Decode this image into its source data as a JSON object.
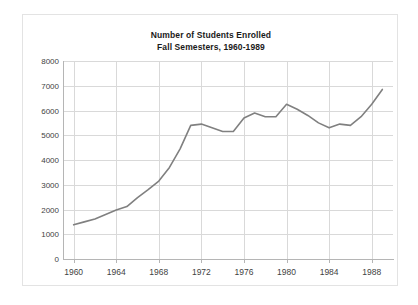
{
  "chart_data": {
    "type": "line",
    "title": "Number of Students Enrolled",
    "subtitle": "Fall Semesters, 1960-1989",
    "title_lines": [
      "Number of Students Enrolled",
      "Fall Semesters, 1960-1989"
    ],
    "xlabel": "",
    "ylabel": "",
    "xlim": [
      1959,
      1990
    ],
    "ylim": [
      0,
      8000
    ],
    "grid": true,
    "legend": "none",
    "line_color": "#808080",
    "grid_color": "#d9d9d9",
    "axis_color": "#b5b5b5",
    "ytick_labels": [
      "8000",
      "7000",
      "6000",
      "5000",
      "4000",
      "3000",
      "2000",
      "1000",
      "0"
    ],
    "ytick_values": [
      8000,
      7000,
      6000,
      5000,
      4000,
      3000,
      2000,
      1000,
      0
    ],
    "xtick_labels": [
      "1960",
      "1964",
      "1968",
      "1972",
      "1976",
      "1980",
      "1984",
      "1988"
    ],
    "xtick_values": [
      1960,
      1964,
      1968,
      1972,
      1976,
      1980,
      1984,
      1988
    ],
    "x": [
      1960,
      1961,
      1962,
      1963,
      1964,
      1965,
      1966,
      1967,
      1968,
      1969,
      1970,
      1971,
      1972,
      1973,
      1974,
      1975,
      1976,
      1977,
      1978,
      1979,
      1980,
      1981,
      1982,
      1983,
      1984,
      1985,
      1986,
      1987,
      1988,
      1989
    ],
    "values": [
      1380,
      1500,
      1620,
      1800,
      1980,
      2120,
      2480,
      2800,
      3150,
      3700,
      4450,
      5400,
      5450,
      5300,
      5150,
      5150,
      5700,
      5900,
      5750,
      5750,
      6250,
      6050,
      5800,
      5500,
      5300,
      5450,
      5400,
      5750,
      6250,
      6850
    ],
    "series": [
      {
        "name": "Students Enrolled",
        "values": [
          1380,
          1500,
          1620,
          1800,
          1980,
          2120,
          2480,
          2800,
          3150,
          3700,
          4450,
          5400,
          5450,
          5300,
          5150,
          5150,
          5700,
          5900,
          5750,
          5750,
          6250,
          6050,
          5800,
          5500,
          5300,
          5450,
          5400,
          5750,
          6250,
          6850
        ]
      }
    ]
  }
}
